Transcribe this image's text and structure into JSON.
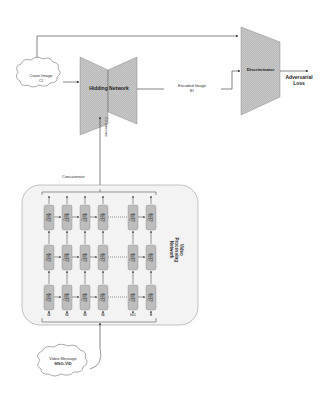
{
  "diagram": {
    "cover_image": {
      "line1": "Cover Image",
      "line2": "CI"
    },
    "hidding_network": {
      "label": "Hidding Network"
    },
    "encoded_image": {
      "line1": "Encoded Image",
      "line2": "EI"
    },
    "discriminator": {
      "label": "Discriminator"
    },
    "adversarial_loss": {
      "line1": "Adversarial",
      "line2": "Loss"
    },
    "concatenate_top": "Concatenate",
    "concatenate_vertical": "Concatenate",
    "video_processing_network": {
      "line1": "Video",
      "line2": "Processing",
      "line3": "Network"
    },
    "cell_label": {
      "line1": "Conv",
      "line2": "LSTM"
    },
    "frames": [
      "f1",
      "f2",
      "f3",
      "f4",
      "ft-1",
      "ft"
    ],
    "video_message": {
      "line1": "Video Message",
      "line2": "MSG-VID"
    },
    "colors": {
      "trapezoid_fill": "#c8c8c8",
      "cell_fill": "#bdbdbd",
      "panel_fill": "#f3f3f3",
      "line": "#333333"
    }
  }
}
